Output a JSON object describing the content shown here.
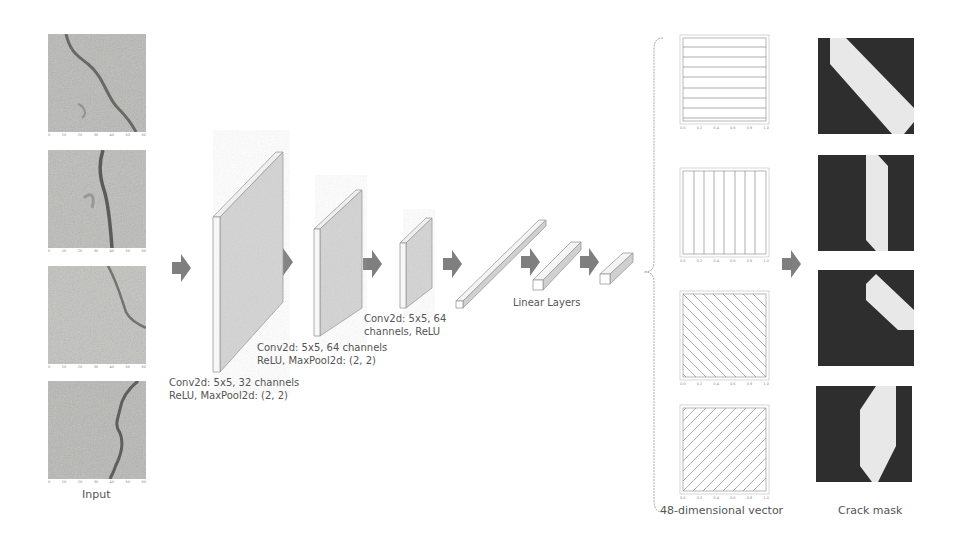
{
  "diagram": {
    "input": {
      "caption": "Input",
      "panels": [
        {
          "id": 1,
          "x_ticks": [
            "0",
            "10",
            "20",
            "30",
            "40",
            "50",
            "60"
          ],
          "y_ticks": [
            "0",
            "10",
            "20",
            "30",
            "40",
            "50",
            "60"
          ]
        },
        {
          "id": 2,
          "x_ticks": [
            "0",
            "10",
            "20",
            "30",
            "40",
            "50",
            "60"
          ],
          "y_ticks": [
            "0",
            "10",
            "20",
            "30",
            "40",
            "50",
            "60"
          ]
        },
        {
          "id": 3,
          "x_ticks": [
            "0",
            "10",
            "20",
            "30",
            "40",
            "50",
            "60"
          ],
          "y_ticks": [
            "0",
            "10",
            "20",
            "30",
            "40",
            "50",
            "60"
          ]
        },
        {
          "id": 4,
          "x_ticks": [
            "0",
            "10",
            "20",
            "30",
            "40",
            "50",
            "60"
          ],
          "y_ticks": [
            "0",
            "10",
            "20",
            "30",
            "40",
            "50",
            "60"
          ]
        }
      ]
    },
    "layers": {
      "conv1": {
        "line1": "Conv2d: 5x5, 32 channels",
        "line2": "ReLU, MaxPool2d: (2, 2)"
      },
      "conv2": {
        "line1": "Conv2d: 5x5, 64 channels",
        "line2": "ReLU, MaxPool2d: (2, 2)"
      },
      "conv3": {
        "line1": "Conv2d: 5x5, 64",
        "line2": "channels, ReLU"
      },
      "linear": {
        "label": "Linear Layers"
      }
    },
    "vector": {
      "caption": "48-dimensional vector",
      "panels": [
        {
          "pattern": "horizontal-lines",
          "x_ticks": [
            "0.0",
            "0.2",
            "0.4",
            "0.6",
            "0.8",
            "1.0"
          ],
          "y_ticks": [
            "0.0",
            "0.2",
            "0.4",
            "0.6",
            "0.8",
            "1.0"
          ]
        },
        {
          "pattern": "vertical-lines",
          "x_ticks": [
            "0.0",
            "0.2",
            "0.4",
            "0.6",
            "0.8",
            "1.0"
          ],
          "y_ticks": [
            "0.0",
            "0.2",
            "0.4",
            "0.6",
            "0.8",
            "1.0"
          ]
        },
        {
          "pattern": "diagonal-down-lines",
          "x_ticks": [
            "0.0",
            "0.2",
            "0.4",
            "0.6",
            "0.8",
            "1.0"
          ],
          "y_ticks": [
            "0.0",
            "0.2",
            "0.4",
            "0.6",
            "0.8",
            "1.0"
          ]
        },
        {
          "pattern": "diagonal-up-lines",
          "x_ticks": [
            "0.0",
            "0.2",
            "0.4",
            "0.6",
            "0.8",
            "1.0"
          ],
          "y_ticks": [
            "0.0",
            "0.2",
            "0.4",
            "0.6",
            "0.8",
            "1.0"
          ]
        }
      ]
    },
    "output": {
      "caption": "Crack mask",
      "panels": [
        {
          "shape": "diagonal-band"
        },
        {
          "shape": "vertical-band"
        },
        {
          "shape": "short-diagonal-band"
        },
        {
          "shape": "wide-vertical-band"
        }
      ]
    },
    "colors": {
      "arrow": "#7f7f7f",
      "layer_face": "#d4d4d4",
      "layer_edge": "#f4f4f4",
      "mask_bg": "#2e2e2e",
      "mask_fg": "#e8e8e8",
      "text": "#555555"
    }
  }
}
